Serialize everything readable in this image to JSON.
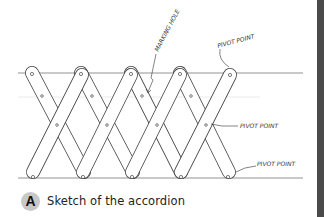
{
  "figure": {
    "caption_badge": "A",
    "caption_text": "Sketch of the accordion"
  },
  "annotations": {
    "marking_hole": "MARKING HOLE",
    "pivot_point_top": "PIVOT POINT",
    "pivot_point_middle": "PIVOT POINT",
    "pivot_point_bottom": "PIVOT POINT"
  },
  "colors": {
    "ink": "#333333",
    "guide_line": "#999999",
    "badge_bg": "#c8c8c8",
    "side_bar": "#4a4a4a"
  }
}
